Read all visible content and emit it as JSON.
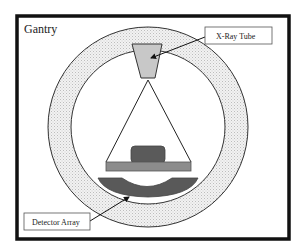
{
  "diagram": {
    "type": "ct-scanner-schematic",
    "frame_label": "Gantry",
    "labels": {
      "xray_tube": "X-Ray Tube",
      "detector_array": "Detector Array"
    },
    "components": [
      {
        "id": "gantry",
        "label": "Gantry",
        "shape": "ring"
      },
      {
        "id": "xray-tube",
        "label": "X-Ray Tube",
        "shape": "trapezoid"
      },
      {
        "id": "xray-beam",
        "label": "",
        "shape": "fan-beam"
      },
      {
        "id": "patient-object",
        "label": "",
        "shape": "rounded-rect"
      },
      {
        "id": "patient-table",
        "label": "",
        "shape": "rect"
      },
      {
        "id": "detector-array",
        "label": "Detector Array",
        "shape": "curved-arc"
      }
    ],
    "colors": {
      "frame_border": "#111111",
      "ring_fill": "#e6e6e6",
      "ring_stroke": "#333333",
      "tube_fill": "#c8c8c8",
      "object_fill": "#5a5a5a",
      "table_fill": "#8c8c8c",
      "detector_fill": "#595959",
      "line": "#222222"
    }
  }
}
